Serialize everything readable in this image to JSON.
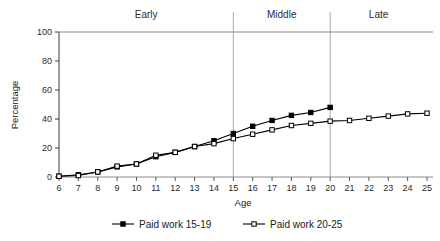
{
  "chart_data": {
    "type": "line",
    "title": "",
    "xlabel": "Age",
    "ylabel": "Percentage",
    "xlim": [
      6,
      25
    ],
    "ylim": [
      0,
      100
    ],
    "grid": false,
    "legend_position": "bottom",
    "x": [
      6,
      7,
      8,
      9,
      10,
      11,
      12,
      13,
      14,
      15,
      16,
      17,
      18,
      19,
      20,
      21,
      22,
      23,
      24,
      25
    ],
    "xticklabels": [
      "6",
      "7",
      "8",
      "9",
      "10",
      "11",
      "12",
      "13",
      "14",
      "15",
      "16",
      "17",
      "18",
      "19",
      "20",
      "21",
      "22",
      "23",
      "24",
      "25"
    ],
    "yticks": [
      0,
      20,
      40,
      60,
      80,
      100
    ],
    "yticklabels": [
      "0",
      "20",
      "40",
      "60",
      "80",
      "100"
    ],
    "series": [
      {
        "name": "Paid work 15-19",
        "marker": "filled-square",
        "color": "#000000",
        "x": [
          6,
          7,
          8,
          9,
          10,
          11,
          12,
          13,
          14,
          15,
          16,
          17,
          18,
          19,
          20
        ],
        "values": [
          0.5,
          1.5,
          3.5,
          7,
          9,
          14,
          17,
          21,
          25,
          30,
          35,
          39,
          42.5,
          44.5,
          48
        ]
      },
      {
        "name": "Paid work 20-25",
        "marker": "open-square",
        "color": "#000000",
        "x": [
          6,
          7,
          8,
          9,
          10,
          11,
          12,
          13,
          14,
          15,
          16,
          17,
          18,
          19,
          20,
          21,
          22,
          23,
          24,
          25
        ],
        "values": [
          0.5,
          1,
          3.5,
          7.5,
          9,
          15,
          17,
          21,
          23,
          26.5,
          29.5,
          32.5,
          35.5,
          37,
          38.5,
          39,
          40.5,
          42,
          43.5,
          44
        ]
      }
    ],
    "annotations": [
      {
        "label": "Early",
        "x_start": 6,
        "x_end": 15,
        "divider_x": 15
      },
      {
        "label": "Middle",
        "x_start": 15,
        "x_end": 20,
        "divider_x": 20
      },
      {
        "label": "Late",
        "x_start": 20,
        "x_end": 25,
        "divider_x": null
      }
    ],
    "divider_lines": [
      15,
      20
    ]
  },
  "legend": {
    "items": [
      {
        "label": "Paid work 15-19",
        "marker": "filled-square"
      },
      {
        "label": "Paid work 20-25",
        "marker": "open-square"
      }
    ]
  },
  "axes": {
    "x_title": "Age",
    "y_title": "Percentage"
  },
  "period_labels": {
    "early": "Early",
    "middle": "Middle",
    "late": "Late"
  }
}
